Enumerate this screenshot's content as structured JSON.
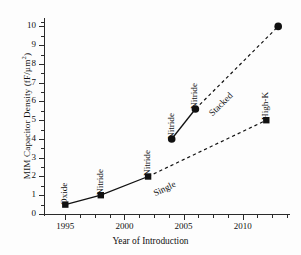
{
  "chart_data": {
    "type": "line",
    "title": "",
    "xlabel": "Year of Introduction",
    "ylabel": "MIM Capacitor Density (fF/µm",
    "ylabel_sup": "2",
    "ylabel_tail": ")",
    "xlim": [
      1993.2,
      2014.0
    ],
    "ylim": [
      0,
      10.45
    ],
    "grid": false,
    "legend": "none",
    "xticks": [
      1995,
      2000,
      2005,
      2010
    ],
    "xtick_labels": [
      "1995",
      "2000",
      "2005",
      "2010"
    ],
    "xticks_minor": [
      1996.25,
      1997.5,
      1998.75,
      2001.25,
      2002.5,
      2003.75,
      2006.25,
      2007.5,
      2008.75,
      2011.25,
      2012.5,
      2013.75
    ],
    "yticks": [
      0,
      1,
      2,
      3,
      4,
      5,
      6,
      7,
      8,
      9,
      10
    ],
    "ytick_labels": [
      "0",
      "1",
      "2",
      "3",
      "4",
      "5",
      "6",
      "7",
      "8",
      "9",
      "10"
    ],
    "yticks_minor": [
      0.5,
      1.5,
      2.5,
      3.5,
      4.5,
      5.5,
      6.5,
      7.5,
      8.5,
      9.5,
      10.25
    ],
    "series": [
      {
        "name": "single",
        "marker": "square",
        "color": "#111111",
        "points": [
          {
            "x": 1995,
            "y": 0.5,
            "label": "Oxide"
          },
          {
            "x": 1998,
            "y": 1.0,
            "label": "Nitride"
          },
          {
            "x": 2002,
            "y": 2.0,
            "label": "Nitride"
          },
          {
            "x": 2012,
            "y": 5.0,
            "label": "High-K"
          }
        ],
        "solid_through_index": 2,
        "segment_label": "Single"
      },
      {
        "name": "stacked",
        "marker": "circle",
        "color": "#111111",
        "points": [
          {
            "x": 2004,
            "y": 4.0,
            "label": "Nitride"
          },
          {
            "x": 2006,
            "y": 5.6,
            "label": "Nitride"
          },
          {
            "x": 2013,
            "y": 10.0,
            "label": ""
          }
        ],
        "solid_through_index": 1,
        "segment_label": "Stacked"
      }
    ]
  }
}
